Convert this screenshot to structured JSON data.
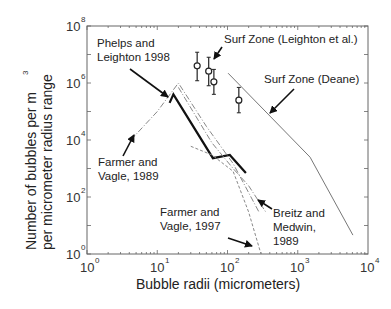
{
  "chart_data": {
    "type": "line",
    "title": "",
    "xlabel": "Bubble radii (micrometers)",
    "ylabel_line1": "Number of bubbles per m",
    "ylabel_sup": "3",
    "ylabel_line2": "per micrometer radius range",
    "xscale": "log",
    "yscale": "log",
    "xlim": [
      1,
      10000
    ],
    "ylim": [
      1,
      100000000
    ],
    "grid": false,
    "legend": "none (inline annotations with arrows)",
    "x_ticks": [
      {
        "base": "10",
        "exp": "0"
      },
      {
        "base": "10",
        "exp": "1"
      },
      {
        "base": "10",
        "exp": "2"
      },
      {
        "base": "10",
        "exp": "3"
      },
      {
        "base": "10",
        "exp": "4"
      }
    ],
    "y_ticks": [
      {
        "base": "10",
        "exp": "0"
      },
      {
        "base": "10",
        "exp": "2"
      },
      {
        "base": "10",
        "exp": "4"
      },
      {
        "base": "10",
        "exp": "6"
      },
      {
        "base": "10",
        "exp": "8"
      }
    ],
    "series": [
      {
        "name": "Phelps and Leighton 1998",
        "style": "thick solid black",
        "points": [
          [
            15,
            200000
          ],
          [
            17,
            400000
          ],
          [
            62,
            2300
          ],
          [
            108,
            3000
          ],
          [
            183,
            700
          ]
        ]
      },
      {
        "name": "Surf Zone (Deane)",
        "style": "thin solid gray",
        "points": [
          [
            102,
            2200000
          ],
          [
            1500,
            2500
          ],
          [
            6100,
            4.6
          ]
        ]
      },
      {
        "name": "Surf Zone (Leighton et al.)",
        "style": "circle markers with error bars",
        "points": [
          [
            37,
            4000000
          ],
          [
            54,
            2600000
          ],
          [
            64,
            1100000
          ],
          [
            145,
            250000
          ]
        ],
        "error_low": [
          1200000,
          800000,
          400000,
          90000
        ],
        "error_high": [
          12000000,
          8000000,
          3000000,
          700000
        ]
      },
      {
        "name": "Farmer and Vagle, 1989",
        "style": "dash-dot gray",
        "points": [
          [
            4.2,
            10000
          ],
          [
            10,
            100000
          ],
          [
            20,
            1000000
          ],
          [
            50,
            30000
          ],
          [
            120,
            1500
          ],
          [
            280,
            30
          ]
        ]
      },
      {
        "name": "Farmer and Vagle, 1997",
        "style": "dashed gray",
        "points": [
          [
            30,
            6000
          ],
          [
            60,
            3000
          ],
          [
            120,
            800
          ],
          [
            200,
            30
          ],
          [
            300,
            1
          ]
        ]
      },
      {
        "name": "Breitz and Medwin, 1989",
        "style": "dash-dot gray",
        "points": [
          [
            20,
            700000
          ],
          [
            60,
            8000
          ],
          [
            120,
            1000
          ],
          [
            200,
            250
          ],
          [
            350,
            30
          ]
        ]
      }
    ],
    "annotations": [
      {
        "text_lines": [
          "Phelps and",
          "Leighton 1998"
        ],
        "arrow_to": [
          17,
          400000
        ]
      },
      {
        "text_lines": [
          "Surf Zone (Leighton et al.)"
        ],
        "arrow_to": [
          54,
          2600000
        ]
      },
      {
        "text_lines": [
          "Surf Zone (Deane)"
        ],
        "arrow_to": [
          250,
          200000
        ]
      },
      {
        "text_lines": [
          "Farmer and",
          "Vagle, 1989"
        ],
        "arrow_to": [
          4.2,
          10000
        ]
      },
      {
        "text_lines": [
          "Farmer and",
          "Vagle, 1997"
        ],
        "arrow_to": [
          270,
          1.5
        ]
      },
      {
        "text_lines": [
          "Breitz and",
          "Medwin,",
          "1989"
        ],
        "arrow_to": [
          350,
          300
        ]
      }
    ]
  },
  "labels": {
    "xlabel": "Bubble radii (micrometers)",
    "ylabel_line1": "Number of bubbles per m",
    "ylabel_sup": "3",
    "ylabel_line2": "per micrometer radius range",
    "ann_phelps_1": "Phelps and",
    "ann_phelps_2": "Leighton 1998",
    "ann_leighton": "Surf Zone (Leighton et al.)",
    "ann_deane": "Surf Zone (Deane)",
    "ann_fv89_1": "Farmer and",
    "ann_fv89_2": "Vagle, 1989",
    "ann_fv97_1": "Farmer and",
    "ann_fv97_2": "Vagle, 1997",
    "ann_bm_1": "Breitz and",
    "ann_bm_2": "Medwin,",
    "ann_bm_3": "1989"
  }
}
